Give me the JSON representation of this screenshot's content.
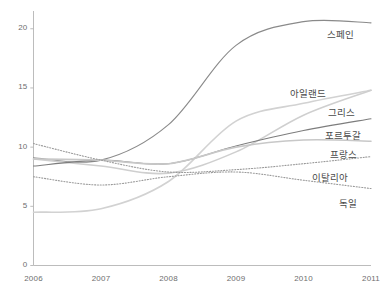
{
  "chart_data": {
    "type": "line",
    "title": "",
    "subtitle": "",
    "xlabel": "",
    "ylabel": "",
    "x": [
      2006,
      2007,
      2008,
      2009,
      2010,
      2011
    ],
    "xtick_labels": [
      "2006",
      "2007",
      "2008",
      "2009",
      "2010",
      "2011"
    ],
    "ytick_labels": [
      "0",
      "5",
      "10",
      "15",
      "20"
    ],
    "ytick_values": [
      0,
      5,
      10,
      15,
      20
    ],
    "xlim": [
      2006,
      2011
    ],
    "ylim": [
      0,
      21.5
    ],
    "grid": false,
    "legend_position": "right-inline-labels",
    "series": [
      {
        "name": "스페인",
        "values": [
          9.1,
          8.9,
          11.9,
          18.6,
          20.6,
          20.5
        ],
        "color": "#8a8a8a",
        "style": "solid",
        "width": 1.1
      },
      {
        "name": "아일랜드",
        "values": [
          4.5,
          4.8,
          7.1,
          12.2,
          13.7,
          14.8
        ],
        "color": "#d2d2d2",
        "style": "solid",
        "width": 1.6
      },
      {
        "name": "그리스",
        "values": [
          9.0,
          8.4,
          7.8,
          9.6,
          12.7,
          14.8
        ],
        "color": "#cfcfcf",
        "style": "solid",
        "width": 1.6
      },
      {
        "name": "포르투갈",
        "values": [
          8.4,
          8.9,
          8.6,
          10.1,
          11.4,
          12.4
        ],
        "color": "#7d7d7d",
        "style": "solid",
        "width": 1.1
      },
      {
        "name": "프랑스",
        "values": [
          9.0,
          8.9,
          8.6,
          10.0,
          10.6,
          10.5
        ],
        "color": "#c8c8c8",
        "style": "solid",
        "width": 1.6
      },
      {
        "name": "이탈리아",
        "values": [
          10.3,
          8.9,
          7.9,
          8.1,
          8.6,
          9.2
        ],
        "color": "#9a9a9a",
        "style": "dotted",
        "width": 1.1
      },
      {
        "name": "독일",
        "values": [
          7.5,
          6.8,
          7.5,
          7.9,
          7.2,
          6.5
        ],
        "color": "#9a9a9a",
        "style": "dotted",
        "width": 1.1
      }
    ],
    "series_labels": [
      {
        "text": "스페인",
        "x": 327,
        "y": 27
      },
      {
        "text": "아일랜드",
        "x": 290,
        "y": 86
      },
      {
        "text": "그리스",
        "x": 328,
        "y": 105
      },
      {
        "text": "포르투갈",
        "x": 325,
        "y": 128
      },
      {
        "text": "프랑스",
        "x": 330,
        "y": 147
      },
      {
        "text": "이탈리아",
        "x": 312,
        "y": 170
      },
      {
        "text": "독일",
        "x": 339,
        "y": 196
      }
    ],
    "axis_color": "#b4b4b4",
    "text_color": "#6e6e6e"
  },
  "footnote": {
    "text": ""
  }
}
